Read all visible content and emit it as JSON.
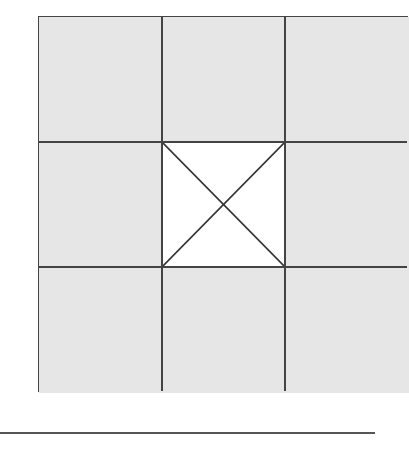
{
  "diagram": {
    "type": "3x3 grid",
    "rows": 3,
    "cols": 3,
    "cell_fill": "#e6e6e6",
    "center_cell_fill": "#ffffff",
    "center_cell_mark": "x-cross",
    "line_color": "#444444"
  }
}
